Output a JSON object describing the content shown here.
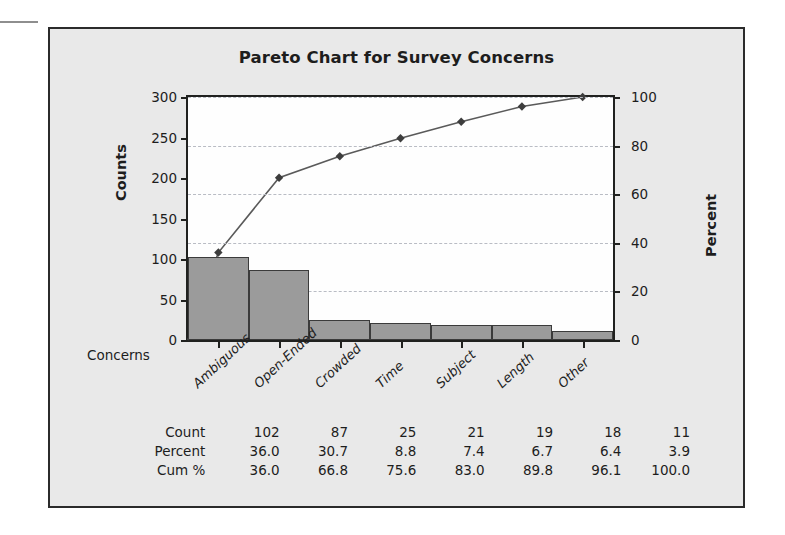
{
  "figure": {
    "title": "Pareto Chart for Survey Concerns",
    "background_color": "#e9e9e9",
    "frame_color": "#2b2b2b",
    "plot_background": "#fefefe",
    "bar_fill_color": "#9b9b9b",
    "bar_edge_color": "#3b3b3b",
    "gridline_color": "#b9bcc4",
    "line_color": "#5a5a5a"
  },
  "axes": {
    "left_title": "Counts",
    "right_title": "Percent",
    "category_axis_label": "Concerns",
    "left_ticks": [
      "0",
      "50",
      "100",
      "150",
      "200",
      "250",
      "300"
    ],
    "right_ticks": [
      "0",
      "20",
      "40",
      "60",
      "80",
      "100"
    ]
  },
  "table": {
    "rows": [
      {
        "label": "Count",
        "values": [
          "102",
          "87",
          "25",
          "21",
          "19",
          "18",
          "11"
        ]
      },
      {
        "label": "Percent",
        "values": [
          "36.0",
          "30.7",
          "8.8",
          "7.4",
          "6.7",
          "6.4",
          "3.9"
        ]
      },
      {
        "label": "Cum %",
        "values": [
          "36.0",
          "66.8",
          "75.6",
          "83.0",
          "89.8",
          "96.1",
          "100.0"
        ]
      }
    ]
  },
  "chart_data": {
    "type": "bar",
    "title": "Pareto Chart for Survey Concerns",
    "xlabel": "Concerns",
    "ylabel": "Counts",
    "y2label": "Percent",
    "categories": [
      "Ambiguous",
      "Open-Ended",
      "Crowded",
      "Time",
      "Subject",
      "Length",
      "Other"
    ],
    "series": [
      {
        "name": "Count",
        "type": "bar",
        "axis": "left",
        "values": [
          102,
          87,
          25,
          21,
          19,
          18,
          11
        ]
      },
      {
        "name": "Percent",
        "type": "annotation",
        "values": [
          36.0,
          30.7,
          8.8,
          7.4,
          6.7,
          6.4,
          3.9
        ]
      },
      {
        "name": "Cum %",
        "type": "line",
        "axis": "right",
        "values": [
          36.0,
          66.8,
          75.6,
          83.0,
          89.8,
          96.1,
          100.0
        ]
      }
    ],
    "ylim": [
      0,
      300
    ],
    "y2lim": [
      0,
      100
    ],
    "yticks": [
      0,
      50,
      100,
      150,
      200,
      250,
      300
    ],
    "y2ticks": [
      0,
      20,
      40,
      60,
      80,
      100
    ],
    "grid": true,
    "grid_axis": "y2",
    "legend": "none",
    "total_count": 283
  }
}
